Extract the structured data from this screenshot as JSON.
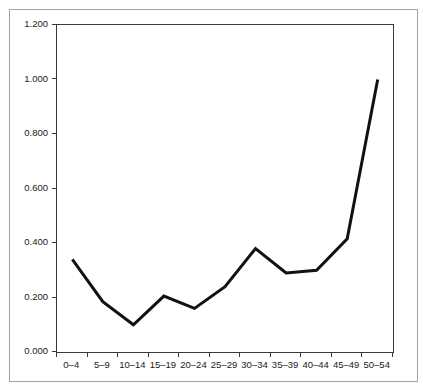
{
  "figure": {
    "background_color": "#ffffff",
    "frame_border_color": "#a3a3a3",
    "plot_border_color": "#3a3a3a"
  },
  "chart_data": {
    "type": "line",
    "title": "",
    "xlabel": "",
    "ylabel": "",
    "categories": [
      "0–4",
      "5–9",
      "10–14",
      "15–19",
      "20–24",
      "25–29",
      "30–34",
      "35–39",
      "40–44",
      "45–49",
      "50–54"
    ],
    "values": [
      0.34,
      0.185,
      0.1,
      0.205,
      0.16,
      0.24,
      0.38,
      0.29,
      0.3,
      0.415,
      1.0
    ],
    "series": [
      {
        "name": "rate",
        "values": [
          0.34,
          0.185,
          0.1,
          0.205,
          0.16,
          0.24,
          0.38,
          0.29,
          0.3,
          0.415,
          1.0
        ]
      }
    ],
    "ylim": [
      0,
      1.2
    ],
    "y_tick_labels": [
      "0.000",
      "0.200",
      "0.400",
      "0.600",
      "0.800",
      "1.000",
      "1.200"
    ],
    "y_tick_values": [
      0,
      0.2,
      0.4,
      0.6,
      0.8,
      1.0,
      1.2
    ],
    "grid": false,
    "legend_position": "none",
    "line_color": "#111111",
    "line_width": 3
  }
}
